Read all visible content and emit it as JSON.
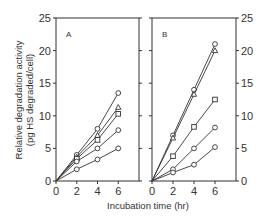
{
  "chart_data": [
    {
      "type": "line",
      "panel": "A",
      "title": "",
      "xlabel": "Incubation time (hr)",
      "ylabel": "Relative degradation activity (pg HS degraded/cell)",
      "xlim": [
        0,
        8
      ],
      "ylim": [
        0,
        25
      ],
      "xticks": [
        0,
        2,
        4,
        6
      ],
      "yticks": [
        0,
        5,
        10,
        15,
        20,
        25
      ],
      "grid": false,
      "x": [
        0,
        2,
        4,
        6
      ],
      "series": [
        {
          "name": "circle-top",
          "marker": "circle",
          "values": [
            0,
            4.0,
            8.0,
            13.5
          ]
        },
        {
          "name": "triangle",
          "marker": "triangle",
          "values": [
            0,
            3.7,
            7.0,
            11.3
          ]
        },
        {
          "name": "square",
          "marker": "square",
          "values": [
            0,
            3.4,
            6.3,
            10.3
          ]
        },
        {
          "name": "circle-mid",
          "marker": "circle",
          "values": [
            0,
            3.0,
            5.0,
            7.8
          ]
        },
        {
          "name": "circle-low",
          "marker": "circle",
          "values": [
            0,
            1.8,
            3.3,
            5.0
          ]
        }
      ]
    },
    {
      "type": "line",
      "panel": "B",
      "title": "",
      "xlabel": "Incubation time (hr)",
      "ylabel": "",
      "xlim": [
        0,
        8
      ],
      "ylim": [
        0,
        25
      ],
      "xticks": [
        0,
        2,
        4,
        6
      ],
      "yticks": [
        0,
        5,
        10,
        15,
        20,
        25
      ],
      "y_axis_side": "right",
      "grid": false,
      "x": [
        0,
        2,
        4,
        6
      ],
      "series": [
        {
          "name": "circle-top",
          "marker": "circle",
          "values": [
            0,
            7.0,
            14.0,
            21.0
          ]
        },
        {
          "name": "triangle",
          "marker": "triangle",
          "values": [
            0,
            6.6,
            13.3,
            20.0
          ]
        },
        {
          "name": "square",
          "marker": "square",
          "values": [
            0,
            3.8,
            8.3,
            12.5
          ]
        },
        {
          "name": "circle-mid",
          "marker": "circle",
          "values": [
            0,
            1.8,
            5.0,
            8.2
          ]
        },
        {
          "name": "circle-low",
          "marker": "circle",
          "values": [
            0,
            1.3,
            2.5,
            5.2
          ]
        }
      ]
    }
  ],
  "labels": {
    "panel_a": "A",
    "panel_b": "B",
    "xlabel": "Incubation time (hr)",
    "ylabel_line1": "Relative degradation activity",
    "ylabel_line2": "(pg HS degraded/cell)"
  }
}
